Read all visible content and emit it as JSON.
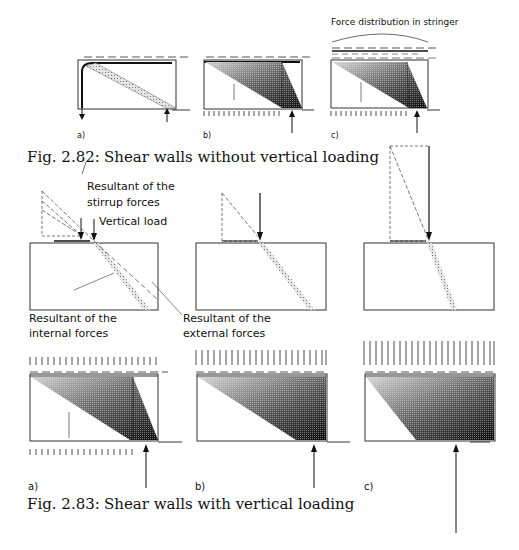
{
  "figure_282": {
    "caption_number": "Fig. 2.82:",
    "caption_text": "Shear walls without vertical loading",
    "header_label": "Force distribution in stringer",
    "panels": [
      {
        "label": "a)"
      },
      {
        "label": "b)"
      },
      {
        "label": "c)"
      }
    ]
  },
  "force_resultants": {
    "labels": {
      "stirrup": "Resultant of the\nstirrup forces",
      "stirrup_line1": "Resultant of the",
      "stirrup_line2": "stirrup forces",
      "vertical_load": "Vertical load",
      "internal_line1": "Resultant of the",
      "internal_line2": "internal forces",
      "external_line1": "Resultant of the",
      "external_line2": "external forces"
    }
  },
  "figure_283": {
    "caption_number": "Fig. 2.83:",
    "caption_text": "Shear walls with vertical loading",
    "panels": [
      {
        "label": "a)"
      },
      {
        "label": "b)"
      },
      {
        "label": "c)"
      }
    ]
  },
  "colors": {
    "ink": "#111111",
    "hatch_light": "#bdbdbd",
    "hatch_dark": "#1a1a1a"
  }
}
